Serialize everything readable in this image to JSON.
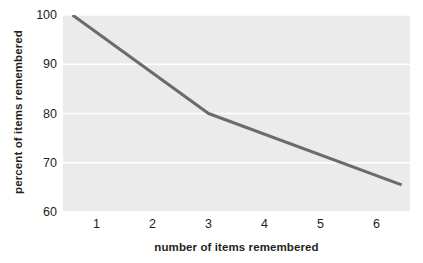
{
  "chart_data": {
    "type": "line",
    "title": "",
    "xlabel": "number of items remembered",
    "ylabel": "percent of items remembered",
    "xlim": [
      0.4,
      6.6
    ],
    "ylim": [
      60,
      100
    ],
    "xticks": [
      "1",
      "2",
      "3",
      "4",
      "5",
      "6"
    ],
    "xtick_values": [
      1,
      2,
      3,
      4,
      5,
      6
    ],
    "yticks": [
      "100",
      "90",
      "80",
      "70",
      "60"
    ],
    "ytick_values": [
      100,
      90,
      80,
      70,
      60
    ],
    "grid": "horizontal-white-gridlines",
    "legend": "none",
    "series": [
      {
        "name": "percent remembered",
        "x": [
          0.57,
          3.0,
          6.45
        ],
        "values": [
          100,
          80,
          65.5
        ]
      }
    ],
    "colors": {
      "plot_background": "#ebebeb",
      "gridline": "#ffffff",
      "line": "#6b6b6b",
      "text": "#231f20",
      "figure_background": "#ffffff"
    },
    "line_width_px": 3
  }
}
